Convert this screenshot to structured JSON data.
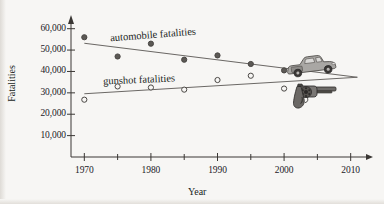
{
  "chart_data": {
    "type": "scatter",
    "title": "",
    "xlabel": "Year",
    "ylabel": "Fatalities",
    "xlim": [
      1968,
      2012
    ],
    "ylim": [
      0,
      65000
    ],
    "grid": false,
    "legend_position": "inline-annotations",
    "x_ticks_major": [
      1970,
      1980,
      1990,
      2000,
      2010
    ],
    "x_tick_labels": [
      "1970",
      "1980",
      "1990",
      "2000",
      "2010"
    ],
    "x_ticks_minor": [
      1975,
      1985,
      1995,
      2005
    ],
    "y_ticks": [
      10000,
      20000,
      30000,
      40000,
      50000,
      60000
    ],
    "y_tick_labels": [
      "10,000",
      "20,000",
      "30,000",
      "40,000",
      "50,000",
      "60,000"
    ],
    "series": [
      {
        "name": "automobile fatalities",
        "marker": "filled-circle",
        "color": "#57534e",
        "x": [
          1970,
          1975,
          1980,
          1985,
          1990,
          1995,
          2000
        ],
        "values": [
          56000,
          47000,
          53000,
          45500,
          47500,
          43500,
          40500
        ],
        "trend_line": {
          "x": [
            1970,
            2011
          ],
          "y": [
            53200,
            37300
          ]
        }
      },
      {
        "name": "gunshot fatalities",
        "marker": "open-circle",
        "color": "#57534e",
        "x": [
          1970,
          1975,
          1980,
          1985,
          1990,
          1995,
          2000
        ],
        "values": [
          26800,
          33000,
          32500,
          31500,
          36000,
          38000,
          32000
        ],
        "trend_line": {
          "x": [
            1970,
            2011
          ],
          "y": [
            29600,
            37300
          ]
        }
      }
    ],
    "annotations": [
      {
        "text": "automobile fatalities",
        "x": 1981,
        "y": 54500
      },
      {
        "text": "gunshot fatalities",
        "x": 1980,
        "y": 38500
      },
      {
        "icon": "car-icon",
        "x": 2004,
        "y": 44000
      },
      {
        "icon": "revolver-icon",
        "x": 2004,
        "y": 34000
      }
    ]
  },
  "axes": {
    "y_title": "Fatalities",
    "x_title": "Year"
  },
  "labels": {
    "automobile": "automobile fatalities",
    "gunshot": "gunshot fatalities"
  },
  "colors": {
    "background": "#f7f6f4",
    "axis": "#3a3734",
    "line": "#6b6865",
    "marker_fill": "#5c5955",
    "marker_edge": "#4a4744",
    "text": "#201e1c"
  }
}
